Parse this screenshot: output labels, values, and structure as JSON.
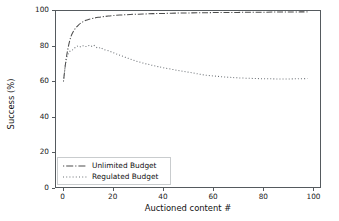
{
  "chart_data": {
    "type": "line",
    "title": "",
    "xlabel": "Auctioned content #",
    "ylabel": "Success (%)",
    "xlim": [
      -3,
      103
    ],
    "ylim": [
      0,
      100
    ],
    "grid": false,
    "legend_position": "lower left",
    "xticks": [
      0,
      20,
      40,
      60,
      80,
      100
    ],
    "yticks": [
      0,
      20,
      40,
      60,
      80,
      100
    ],
    "xtick_labels": [
      "0",
      "20",
      "40",
      "60",
      "80",
      "100"
    ],
    "ytick_labels": [
      "0",
      "20",
      "40",
      "60",
      "80",
      "100"
    ],
    "series": [
      {
        "name": "Unlimited Budget",
        "linestyle": "dashdot",
        "color": "#4d4d4d",
        "x": [
          0,
          1,
          2,
          3,
          4,
          5,
          6,
          7,
          8,
          9,
          10,
          12,
          14,
          16,
          18,
          20,
          24,
          28,
          32,
          36,
          40,
          45,
          50,
          55,
          60,
          65,
          70,
          75,
          80,
          85,
          90,
          95,
          98
        ],
        "values": [
          60.0,
          72.0,
          80.0,
          85.5,
          88.5,
          90.5,
          92.0,
          93.2,
          94.0,
          94.7,
          95.2,
          95.9,
          96.4,
          96.8,
          97.1,
          97.4,
          97.8,
          98.1,
          98.3,
          98.5,
          98.6,
          98.8,
          98.9,
          99.0,
          99.1,
          99.2,
          99.2,
          99.3,
          99.3,
          99.4,
          99.4,
          99.5,
          99.5
        ]
      },
      {
        "name": "Regulated Budget",
        "linestyle": "dotted",
        "color": "#6b7075",
        "x": [
          0,
          1,
          2,
          3,
          4,
          5,
          6,
          7,
          8,
          9,
          10,
          11,
          12,
          13,
          14,
          15,
          16,
          18,
          20,
          22,
          24,
          26,
          28,
          30,
          32,
          34,
          36,
          38,
          40,
          43,
          46,
          49,
          52,
          55,
          58,
          61,
          64,
          67,
          70,
          74,
          78,
          82,
          86,
          90,
          94,
          98
        ],
        "values": [
          60.0,
          71.5,
          76.0,
          77.5,
          78.2,
          79.6,
          80.2,
          79.6,
          80.3,
          79.8,
          80.4,
          79.8,
          80.6,
          79.5,
          78.9,
          79.2,
          78.2,
          77.4,
          76.3,
          75.2,
          74.2,
          73.1,
          72.1,
          71.2,
          70.4,
          69.7,
          69.0,
          68.4,
          67.8,
          67.0,
          66.2,
          65.5,
          64.8,
          64.0,
          63.4,
          63.0,
          62.6,
          62.3,
          62.0,
          61.8,
          61.6,
          61.5,
          61.4,
          61.4,
          61.5,
          61.6
        ]
      }
    ]
  },
  "legend": {
    "items": [
      {
        "label": "Unlimited Budget"
      },
      {
        "label": "Regulated Budget"
      }
    ]
  }
}
